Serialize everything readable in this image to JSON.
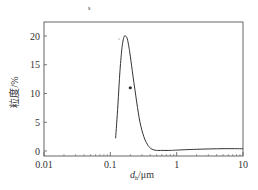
{
  "chart_data": {
    "type": "line",
    "title": "",
    "xlabel": "d_h/μm",
    "xlabel_main": "d",
    "xlabel_sub": "h",
    "xlabel_unit": "/μm",
    "ylabel": "粒度/%",
    "xscale": "log",
    "xlim": [
      0.01,
      10
    ],
    "ylim": [
      -1,
      22
    ],
    "xticks": [
      0.01,
      0.1,
      1,
      10
    ],
    "xtick_labels": [
      "0.01",
      "0.1",
      "1",
      "10"
    ],
    "yticks": [
      0,
      5,
      10,
      15,
      20
    ],
    "ytick_labels": [
      "0",
      "5",
      "10",
      "15",
      "20"
    ],
    "grid": false,
    "legend": null,
    "series": [
      {
        "name": "particle size distribution",
        "x": [
          0.12,
          0.13,
          0.14,
          0.15,
          0.16,
          0.17,
          0.18,
          0.19,
          0.2,
          0.22,
          0.25,
          0.28,
          0.32,
          0.36,
          0.4,
          0.45,
          0.5,
          0.6,
          0.8,
          1.0,
          2.0,
          5.0,
          10.0
        ],
        "y": [
          2.2,
          8.0,
          14.0,
          18.0,
          19.8,
          20.0,
          19.5,
          18.2,
          16.5,
          13.0,
          8.5,
          5.0,
          2.5,
          1.2,
          0.5,
          0.2,
          0.1,
          0.1,
          0.1,
          0.15,
          0.3,
          0.4,
          0.4
        ]
      }
    ],
    "annotations": [
      {
        "type": "marker",
        "x": 0.2,
        "y": 11,
        "text": ""
      }
    ]
  },
  "page_marks": {
    "top_mark": "s"
  }
}
